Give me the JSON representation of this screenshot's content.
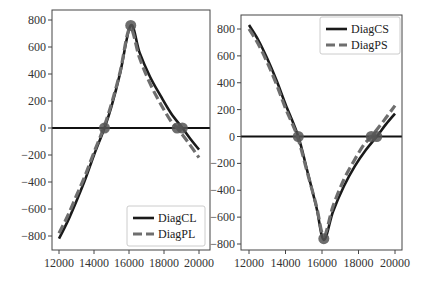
{
  "chart_data": [
    {
      "type": "line",
      "title": "",
      "xlabel": "",
      "ylabel": "",
      "xlim": [
        11800,
        20300
      ],
      "ylim": [
        -880,
        880
      ],
      "xticks": [
        12000,
        14000,
        16000,
        18000,
        20000
      ],
      "yticks": [
        800,
        600,
        400,
        200,
        0,
        -200,
        -400,
        -600,
        -800
      ],
      "grid": false,
      "legend_position": "lower right",
      "hline": 0,
      "series": [
        {
          "name": "DiagCL",
          "style": "solid",
          "color": "#1a1a1a",
          "x": [
            12000,
            12500,
            13000,
            13500,
            14000,
            14600,
            15000,
            15500,
            16100,
            16600,
            17200,
            17800,
            18400,
            19050,
            19500,
            20000
          ],
          "y": [
            -820,
            -690,
            -540,
            -380,
            -200,
            0,
            160,
            410,
            760,
            560,
            380,
            240,
            110,
            0,
            -80,
            -160
          ]
        },
        {
          "name": "DiagPL",
          "style": "dashed",
          "color": "#6e6e6e",
          "x": [
            12000,
            12500,
            13000,
            13500,
            14000,
            14550,
            15000,
            15500,
            16050,
            16600,
            17200,
            17800,
            18400,
            18750,
            19400,
            20000
          ],
          "y": [
            -780,
            -650,
            -500,
            -350,
            -180,
            0,
            180,
            420,
            740,
            520,
            330,
            180,
            50,
            0,
            -110,
            -220
          ]
        },
        {
          "name": "markers-L",
          "style": "points",
          "color": "#555555",
          "x": [
            14600,
            16100,
            18750,
            19050
          ],
          "y": [
            0,
            760,
            0,
            0
          ]
        }
      ]
    },
    {
      "type": "line",
      "title": "",
      "xlabel": "",
      "ylabel": "",
      "xlim": [
        11800,
        20300
      ],
      "ylim": [
        -830,
        900
      ],
      "xticks": [
        12000,
        14000,
        16000,
        18000,
        20000
      ],
      "yticks": [
        800,
        600,
        400,
        200,
        0,
        -200,
        -400,
        -600,
        -800
      ],
      "grid": false,
      "legend_position": "upper right",
      "hline": 0,
      "series": [
        {
          "name": "DiagCS",
          "style": "solid",
          "color": "#1a1a1a",
          "x": [
            12000,
            12500,
            13000,
            13500,
            14000,
            14700,
            15200,
            15700,
            16100,
            16600,
            17200,
            17800,
            18400,
            19000,
            19500,
            20000
          ],
          "y": [
            830,
            720,
            580,
            420,
            240,
            0,
            -260,
            -530,
            -770,
            -560,
            -370,
            -220,
            -100,
            0,
            90,
            170
          ]
        },
        {
          "name": "DiagPS",
          "style": "dashed",
          "color": "#6e6e6e",
          "x": [
            12000,
            12500,
            13000,
            13500,
            14000,
            14650,
            15200,
            15700,
            16100,
            16600,
            17200,
            17800,
            18300,
            18700,
            19400,
            20000
          ],
          "y": [
            800,
            690,
            550,
            390,
            210,
            0,
            -270,
            -520,
            -740,
            -520,
            -320,
            -170,
            -60,
            0,
            120,
            230
          ]
        },
        {
          "name": "markers-R",
          "style": "points",
          "color": "#555555",
          "x": [
            14700,
            16100,
            18700,
            19000
          ],
          "y": [
            0,
            -760,
            0,
            0
          ]
        }
      ]
    }
  ],
  "legends": {
    "left": [
      "DiagCL",
      "DiagPL"
    ],
    "right": [
      "DiagCS",
      "DiagPS"
    ]
  }
}
